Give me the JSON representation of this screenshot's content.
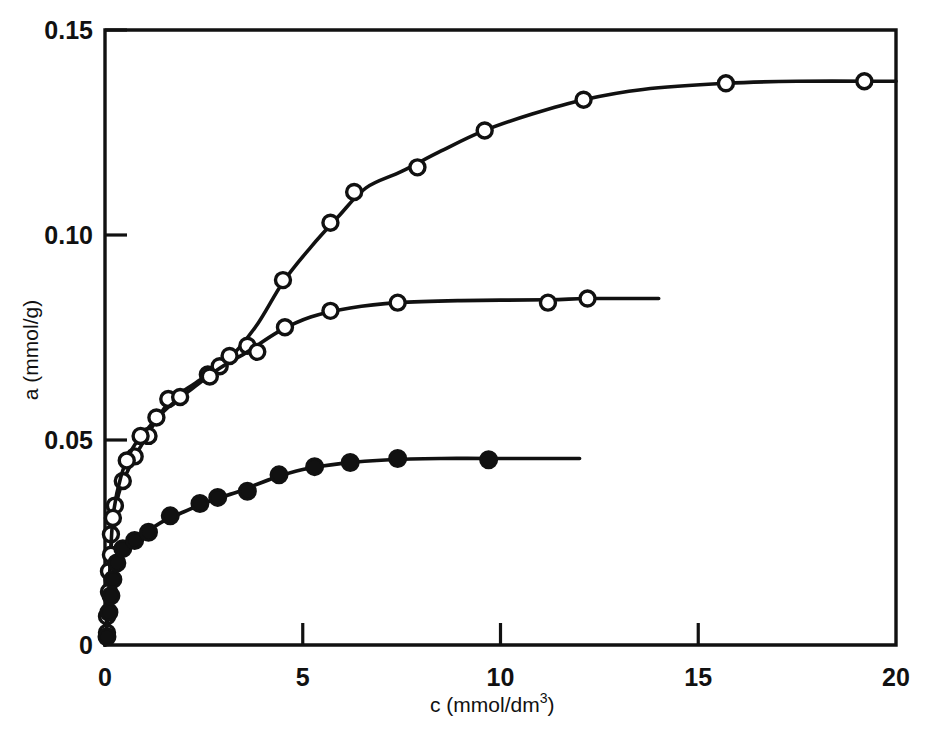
{
  "chart_data": {
    "type": "scatter",
    "title": "",
    "subtitle": "",
    "xlabel": "c (mmol/dm3)",
    "xlabel_base": "c (mmol/dm",
    "xlabel_sup": "3",
    "xlabel_tail": ")",
    "ylabel": "a (mmol/g)",
    "xlim": [
      0,
      20
    ],
    "ylim": [
      0,
      0.15
    ],
    "xticks": [
      0,
      5,
      10,
      15,
      20
    ],
    "xtick_labels": [
      "0",
      "5",
      "10",
      "15",
      "20"
    ],
    "yticks": [
      0,
      0.05,
      0.1,
      0.15
    ],
    "ytick_labels": [
      "0",
      "0.05",
      "0.10",
      "0.15"
    ],
    "grid": false,
    "legend_position": "none",
    "line_color": "#111111",
    "marker_open_fill": "#ffffff",
    "marker_filled_fill": "#111111",
    "series": [
      {
        "name": "upper-isotherm",
        "marker": "open-circle",
        "plateau": 0.137,
        "points": [
          {
            "x": 0.05,
            "y": 0.007
          },
          {
            "x": 0.1,
            "y": 0.018
          },
          {
            "x": 0.15,
            "y": 0.027
          },
          {
            "x": 0.25,
            "y": 0.034
          },
          {
            "x": 0.45,
            "y": 0.04
          },
          {
            "x": 0.75,
            "y": 0.046
          },
          {
            "x": 1.1,
            "y": 0.051
          },
          {
            "x": 1.6,
            "y": 0.06
          },
          {
            "x": 2.6,
            "y": 0.066
          },
          {
            "x": 2.9,
            "y": 0.068
          },
          {
            "x": 3.6,
            "y": 0.073
          },
          {
            "x": 4.5,
            "y": 0.089
          },
          {
            "x": 5.7,
            "y": 0.103
          },
          {
            "x": 6.3,
            "y": 0.1105
          },
          {
            "x": 7.9,
            "y": 0.1165
          },
          {
            "x": 9.6,
            "y": 0.1255
          },
          {
            "x": 12.1,
            "y": 0.133
          },
          {
            "x": 15.7,
            "y": 0.137
          },
          {
            "x": 19.2,
            "y": 0.1375
          }
        ],
        "curve": [
          {
            "x": 0.0,
            "y": 0.0
          },
          {
            "x": 0.1,
            "y": 0.018
          },
          {
            "x": 0.3,
            "y": 0.035
          },
          {
            "x": 0.6,
            "y": 0.043
          },
          {
            "x": 1.0,
            "y": 0.05
          },
          {
            "x": 1.6,
            "y": 0.059
          },
          {
            "x": 2.3,
            "y": 0.064
          },
          {
            "x": 3.0,
            "y": 0.0685
          },
          {
            "x": 3.8,
            "y": 0.0775
          },
          {
            "x": 4.5,
            "y": 0.0885
          },
          {
            "x": 5.2,
            "y": 0.097
          },
          {
            "x": 5.9,
            "y": 0.1045
          },
          {
            "x": 6.6,
            "y": 0.1115
          },
          {
            "x": 7.5,
            "y": 0.1155
          },
          {
            "x": 8.5,
            "y": 0.1205
          },
          {
            "x": 9.6,
            "y": 0.1255
          },
          {
            "x": 10.8,
            "y": 0.1295
          },
          {
            "x": 12.1,
            "y": 0.133
          },
          {
            "x": 13.6,
            "y": 0.1355
          },
          {
            "x": 15.7,
            "y": 0.137
          },
          {
            "x": 17.5,
            "y": 0.1375
          },
          {
            "x": 20.0,
            "y": 0.1375
          }
        ]
      },
      {
        "name": "middle-isotherm",
        "marker": "open-circle",
        "plateau": 0.084,
        "points": [
          {
            "x": 0.05,
            "y": 0.003
          },
          {
            "x": 0.1,
            "y": 0.013
          },
          {
            "x": 0.15,
            "y": 0.022
          },
          {
            "x": 0.2,
            "y": 0.031
          },
          {
            "x": 0.55,
            "y": 0.045
          },
          {
            "x": 0.9,
            "y": 0.051
          },
          {
            "x": 1.3,
            "y": 0.0555
          },
          {
            "x": 1.9,
            "y": 0.0605
          },
          {
            "x": 2.65,
            "y": 0.0655
          },
          {
            "x": 3.15,
            "y": 0.0705
          },
          {
            "x": 3.85,
            "y": 0.0715
          },
          {
            "x": 4.55,
            "y": 0.0775
          },
          {
            "x": 5.7,
            "y": 0.0815
          },
          {
            "x": 7.4,
            "y": 0.0835
          },
          {
            "x": 11.2,
            "y": 0.0835
          },
          {
            "x": 12.2,
            "y": 0.0845
          }
        ],
        "curve": [
          {
            "x": 0.0,
            "y": 0.0
          },
          {
            "x": 0.1,
            "y": 0.014
          },
          {
            "x": 0.2,
            "y": 0.031
          },
          {
            "x": 0.4,
            "y": 0.041
          },
          {
            "x": 0.7,
            "y": 0.048
          },
          {
            "x": 1.1,
            "y": 0.053
          },
          {
            "x": 1.6,
            "y": 0.058
          },
          {
            "x": 2.2,
            "y": 0.0625
          },
          {
            "x": 2.9,
            "y": 0.0675
          },
          {
            "x": 3.6,
            "y": 0.0715
          },
          {
            "x": 4.4,
            "y": 0.0765
          },
          {
            "x": 5.2,
            "y": 0.08
          },
          {
            "x": 6.2,
            "y": 0.0822
          },
          {
            "x": 7.4,
            "y": 0.0835
          },
          {
            "x": 9.0,
            "y": 0.084
          },
          {
            "x": 11.2,
            "y": 0.0842
          },
          {
            "x": 12.2,
            "y": 0.0845
          },
          {
            "x": 14.0,
            "y": 0.0845
          }
        ]
      },
      {
        "name": "lower-isotherm",
        "marker": "filled-circle",
        "plateau": 0.045,
        "points": [
          {
            "x": 0.05,
            "y": 0.002
          },
          {
            "x": 0.1,
            "y": 0.008
          },
          {
            "x": 0.15,
            "y": 0.012
          },
          {
            "x": 0.2,
            "y": 0.016
          },
          {
            "x": 0.3,
            "y": 0.02
          },
          {
            "x": 0.45,
            "y": 0.0235
          },
          {
            "x": 0.75,
            "y": 0.0255
          },
          {
            "x": 1.1,
            "y": 0.0275
          },
          {
            "x": 1.65,
            "y": 0.0315
          },
          {
            "x": 2.4,
            "y": 0.0345
          },
          {
            "x": 2.85,
            "y": 0.036
          },
          {
            "x": 3.6,
            "y": 0.0375
          },
          {
            "x": 4.4,
            "y": 0.0415
          },
          {
            "x": 5.3,
            "y": 0.0435
          },
          {
            "x": 6.2,
            "y": 0.0445
          },
          {
            "x": 7.4,
            "y": 0.0455
          },
          {
            "x": 9.7,
            "y": 0.0452
          }
        ],
        "curve": [
          {
            "x": 0.0,
            "y": 0.0
          },
          {
            "x": 0.1,
            "y": 0.009
          },
          {
            "x": 0.25,
            "y": 0.0185
          },
          {
            "x": 0.5,
            "y": 0.0238
          },
          {
            "x": 0.9,
            "y": 0.0265
          },
          {
            "x": 1.4,
            "y": 0.0298
          },
          {
            "x": 2.0,
            "y": 0.0325
          },
          {
            "x": 2.7,
            "y": 0.0353
          },
          {
            "x": 3.4,
            "y": 0.0375
          },
          {
            "x": 4.2,
            "y": 0.0405
          },
          {
            "x": 5.0,
            "y": 0.0428
          },
          {
            "x": 6.0,
            "y": 0.0443
          },
          {
            "x": 7.2,
            "y": 0.0452
          },
          {
            "x": 8.5,
            "y": 0.0455
          },
          {
            "x": 9.7,
            "y": 0.0455
          },
          {
            "x": 12.0,
            "y": 0.0455
          }
        ]
      }
    ]
  },
  "axes": {
    "x_title_base": "c (mmol/dm",
    "x_title_sup": "3",
    "x_title_tail": ")",
    "y_title": "a (mmol/g)"
  }
}
